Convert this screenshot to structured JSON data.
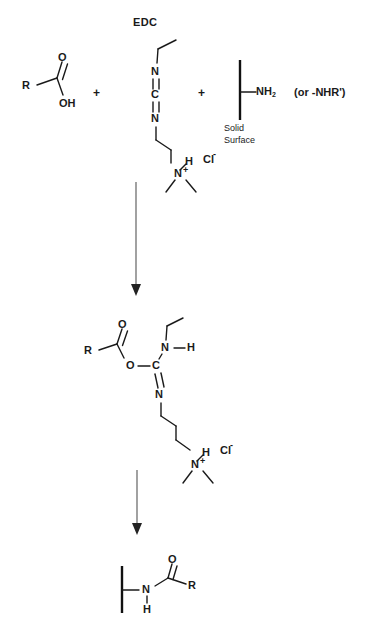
{
  "figure": {
    "type": "chemical-reaction-scheme",
    "background_color": "#ffffff",
    "line_color": "#1a1a1a",
    "arrow_color": "#555555"
  },
  "step1": {
    "reagent_label": "EDC",
    "acid": {
      "r_group": "R",
      "carbonyl_oxygen": "O",
      "hydroxyl": "OH"
    },
    "plus_1": "+",
    "plus_2": "+",
    "edc": {
      "nitrogen_top": "N",
      "carbon_center": "C",
      "nitrogen_bottom": "N",
      "ammonium_h": "H",
      "ammonium_n": "N",
      "ammonium_charge": "+",
      "counterion": "Cl",
      "counterion_charge": "-"
    },
    "surface": {
      "amine": "NH",
      "amine_subscript": "2",
      "alternative": "(or -NHR')",
      "caption_line1": "Solid",
      "caption_line2": "Surface"
    }
  },
  "step2": {
    "intermediate": {
      "r_group": "R",
      "carbonyl_oxygen": "O",
      "ester_oxygen": "O",
      "carbon_center": "C",
      "nitrogen_top": "N",
      "amine_hydrogen": "H",
      "nitrogen_bottom": "N",
      "ammonium_h": "H",
      "ammonium_n": "N",
      "ammonium_charge": "+",
      "counterion": "Cl",
      "counterion_charge": "-"
    }
  },
  "step3": {
    "product": {
      "amide_nitrogen": "N",
      "amide_hydrogen": "H",
      "carbonyl_oxygen": "O",
      "r_group": "R"
    }
  },
  "arrows": {
    "arrow1_name": "reaction-arrow-step1-to-step2",
    "arrow2_name": "reaction-arrow-step2-to-step3"
  }
}
